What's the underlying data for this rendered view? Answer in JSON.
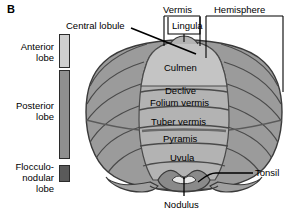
{
  "figure": {
    "panel_letter": "B"
  },
  "legend": {
    "items": [
      {
        "label_line1": "Anterior",
        "label_line2": "lobe",
        "color": "#cfcfcf",
        "name": "anterior-lobe"
      },
      {
        "label_line1": "Posterior",
        "label_line2": "lobe",
        "color": "#8f8f8f",
        "name": "posterior-lobe"
      },
      {
        "label_line1": "Flocculo-",
        "label_line2": "nodular",
        "label_line3": "lobe",
        "color": "#5a5a5a",
        "name": "flocculonodular-lobe"
      }
    ]
  },
  "brackets": {
    "vermis": "Vermis",
    "hemisphere": "Hemisphere"
  },
  "callouts": {
    "central_lobule": "Central lobule",
    "lingula": "Lingula",
    "tonsil": "Tonsil",
    "nodulus": "Nodulus"
  },
  "vermis_segments": [
    {
      "label": "Culmen"
    },
    {
      "label": "Declive"
    },
    {
      "label": "Folium vermis"
    },
    {
      "label": "Tuber vermis"
    },
    {
      "label": "Pyramis"
    },
    {
      "label": "Uvula"
    }
  ],
  "colors": {
    "background": "#ffffff",
    "outline": "#3a3a3a",
    "hemisphere_fill": "#9b9b9b",
    "vermis_fill": "#b3b3b3",
    "vermis_light": "#c4c4c4",
    "tonsil_fill": "#a0a0a0",
    "nodulus_fill": "#8a8a8a",
    "leader_line": "#1a1a1a",
    "text": "#000000"
  }
}
